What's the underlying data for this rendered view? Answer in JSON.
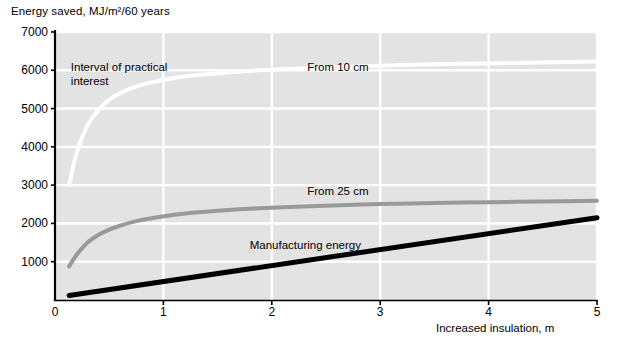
{
  "chart_data": {
    "type": "line",
    "title": "",
    "ylabel": "Energy saved, MJ/m²/60 years",
    "xlabel": "Increased insulation, m",
    "xlim": [
      0,
      5
    ],
    "ylim": [
      0,
      7000
    ],
    "grid": true,
    "legend_position": "inline-annotations",
    "y_ticks": [
      "7000",
      "6000",
      "5000",
      "4000",
      "3000",
      "2000",
      "1000"
    ],
    "y_tick_values": [
      7000,
      6000,
      5000,
      4000,
      3000,
      2000,
      1000
    ],
    "x_ticks": [
      "0",
      "1",
      "2",
      "3",
      "4",
      "5"
    ],
    "x_tick_values": [
      0,
      1,
      2,
      3,
      4,
      5
    ],
    "annotations": [
      {
        "name": "interval-of-practical-interest",
        "text": "Interval of practical\ninterest",
        "x": 0.1,
        "y": 6050
      },
      {
        "name": "from-10-cm",
        "text": "From 10 cm",
        "x": 2.28,
        "y": 6050
      },
      {
        "name": "from-25-cm",
        "text": "From 25 cm",
        "x": 2.28,
        "y": 2830
      },
      {
        "name": "manufacturing-energy",
        "text": "Manufacturing energy",
        "x": 1.75,
        "y": 1420
      }
    ],
    "series": [
      {
        "name": "From 10 cm",
        "label": "From 10 cm",
        "color": "#ffffff",
        "style": "solid",
        "width": 4,
        "x": [
          0.13,
          0.2,
          0.3,
          0.4,
          0.5,
          0.6,
          0.75,
          0.9,
          1.1,
          1.3,
          1.5,
          1.8,
          2.1,
          2.5,
          3.0,
          3.5,
          4.0,
          4.5,
          5.0
        ],
        "y": [
          3000,
          3850,
          4560,
          4960,
          5230,
          5400,
          5580,
          5690,
          5800,
          5870,
          5920,
          5985,
          6030,
          6075,
          6120,
          6155,
          6180,
          6205,
          6230
        ]
      },
      {
        "name": "From 25 cm",
        "label": "From 25 cm",
        "color": "#999999",
        "style": "solid",
        "width": 4,
        "x": [
          0.13,
          0.2,
          0.3,
          0.4,
          0.5,
          0.6,
          0.75,
          0.9,
          1.1,
          1.3,
          1.5,
          1.8,
          2.1,
          2.5,
          3.0,
          3.5,
          4.0,
          4.5,
          5.0
        ],
        "y": [
          880,
          1180,
          1500,
          1700,
          1840,
          1940,
          2060,
          2140,
          2225,
          2285,
          2330,
          2385,
          2425,
          2465,
          2505,
          2535,
          2555,
          2575,
          2595
        ]
      },
      {
        "name": "Manufacturing energy",
        "label": "Manufacturing energy",
        "color": "#000000",
        "style": "solid",
        "width": 5,
        "x": [
          0.13,
          5.0
        ],
        "y": [
          120,
          2150
        ]
      }
    ]
  },
  "axes": {
    "y_axis_name": "energy-saved-axis",
    "x_axis_name": "increased-insulation-axis"
  }
}
